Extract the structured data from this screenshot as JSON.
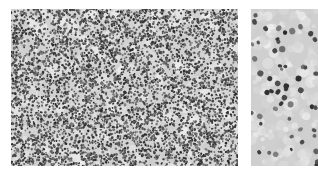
{
  "figure": {
    "panels": [
      {
        "id": "left",
        "label": "low-magnification tissue section",
        "magnification": "low",
        "background": "#d2d2d2",
        "nucleus_color": "#3a3a3a",
        "nuclei_density": 0.55,
        "nucleus_radius": 1.1
      },
      {
        "id": "right",
        "label": "high-magnification tissue section",
        "magnification": "high",
        "background": "#cfcfcf",
        "nucleus_color": "#4a4a4a",
        "nuclei_density": 0.09,
        "nucleus_radius": 2.4
      }
    ]
  }
}
